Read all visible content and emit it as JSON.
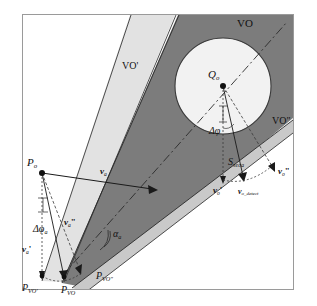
{
  "figure": {
    "border_color": "#9a9a9a",
    "background": "#ffffff"
  },
  "colors": {
    "cone_outer": "#e2e2e2",
    "cone_inner": "#7c7c7c",
    "cone_edge_band": "#c9c9c9",
    "circle_fill": "#f2f2f2",
    "circle_stroke": "#3a3a3a",
    "line": "#1a1a1a",
    "dashed": "#4a4a4a"
  },
  "labels": {
    "vo": "VO",
    "vo_prime": "VO'",
    "vo_double_prime": "VO\"",
    "q_o": "Q",
    "q_o_sub": "o",
    "p_o": "P",
    "p_o_sub": "o",
    "p_vo_prime": "P",
    "p_vo_prime_sub": "VO'",
    "p_vo": "P",
    "p_vo_sub": "VO",
    "p_vo_double_prime": "P",
    "p_vo_double_prime_sub": "VO\"",
    "v_a": "v",
    "v_a_sub": "a",
    "v_a_prime": "v",
    "v_a_prime_sub": "a",
    "v_a_double_prime": "v",
    "v_a_double_prime_sub": "a",
    "v_o": "v",
    "v_o_sub": "o",
    "v_o_prime": "v",
    "v_o_prime_sub": "o",
    "v_o_double_prime": "v",
    "v_o_double_prime_sub": "o",
    "v_o_detect": "v",
    "v_o_detect_sub": "o_detect",
    "delta_phi": "Δφ",
    "delta_phi_a": "Δφ",
    "delta_phi_a_sub": "a",
    "alpha_a": "α",
    "alpha_a_sub": "a",
    "s_seca": "S",
    "s_seca_sub": "seca"
  },
  "geometry": {
    "apex": [
      42,
      173
    ],
    "circle_center": [
      223,
      86
    ],
    "circle_radius": 48,
    "frame": [
      22,
      14,
      272,
      276
    ]
  }
}
